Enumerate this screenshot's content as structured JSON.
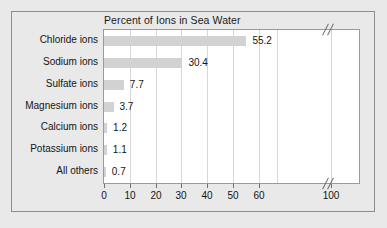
{
  "chart_data": {
    "type": "bar",
    "orientation": "horizontal",
    "title": "Percent of Ions in Sea Water",
    "xlabel": "",
    "ylabel": "",
    "categories": [
      "Chloride ions",
      "Sodium ions",
      "Sulfate ions",
      "Magnesium ions",
      "Calcium ions",
      "Potassium ions",
      "All others"
    ],
    "values": [
      55.2,
      30.4,
      7.7,
      3.7,
      1.2,
      1.1,
      0.7
    ],
    "value_labels": [
      "55.2",
      "30.4",
      "7.7",
      "3.7",
      "1.2",
      "1.1",
      "0.7"
    ],
    "xticks": [
      0,
      10,
      20,
      30,
      40,
      50,
      60,
      100
    ],
    "xtick_labels": [
      "0",
      "10",
      "20",
      "30",
      "40",
      "50",
      "60",
      "100"
    ],
    "xlim": [
      0,
      100
    ],
    "axis_break": {
      "present": true,
      "between": [
        60,
        100
      ],
      "marker": "double-slash"
    },
    "grid": true,
    "legend": false,
    "bar_color": "#d2d2d2",
    "plot_background": "#ffffff",
    "figure_background": "#e9e9e9",
    "gridline_color": "#d7d7d7",
    "text_color": "#141414"
  }
}
